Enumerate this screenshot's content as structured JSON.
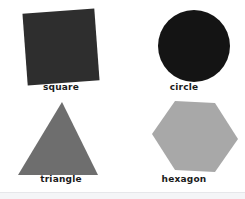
{
  "page": {
    "background_color": "#ffffff",
    "width": 245,
    "height": 199,
    "layout": "2x2-grid"
  },
  "shapes": [
    {
      "id": "square",
      "label": "square",
      "icon": "square-icon",
      "fill_color": "#2e2e2e",
      "rotation_deg": -4.2,
      "sides": 4
    },
    {
      "id": "circle",
      "label": "circle",
      "icon": "circle-icon",
      "fill_color": "#141414",
      "rotation_deg": 0,
      "sides": 0
    },
    {
      "id": "triangle",
      "label": "triangle",
      "icon": "triangle-icon",
      "fill_color": "#6e6e6e",
      "rotation_deg": 0,
      "sides": 3
    },
    {
      "id": "hexagon",
      "label": "hexagon",
      "icon": "hexagon-icon",
      "fill_color": "#a8a8a8",
      "rotation_deg": 0,
      "sides": 6
    }
  ],
  "footer": {
    "band_color": "#f4f5f7",
    "rule_color": "#e6e7ea"
  }
}
